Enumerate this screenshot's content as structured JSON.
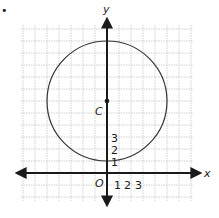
{
  "problem_marker": "•",
  "axes": {
    "x_label": "x",
    "y_label": "y",
    "origin_label": "O",
    "x_ticks": [
      "1",
      "2",
      "3"
    ],
    "y_ticks": [
      "1",
      "2",
      "3"
    ]
  },
  "center": {
    "label": "C",
    "x": 0,
    "y": 6
  },
  "circle": {
    "radius": 5
  },
  "grid": {
    "unit_px": 12,
    "x_min": -7,
    "x_max": 7,
    "y_min": -2,
    "y_max": 12
  },
  "colors": {
    "axis": "#1a1a1a",
    "grid": "#bdbdbd",
    "circle": "#333333"
  }
}
